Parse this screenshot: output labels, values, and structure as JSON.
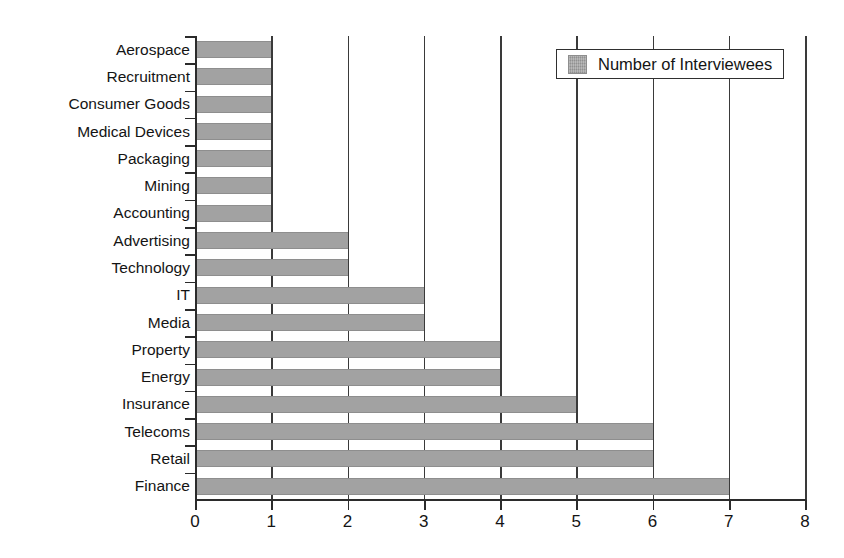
{
  "chart_data": {
    "type": "bar",
    "orientation": "horizontal",
    "title": "",
    "xlabel": "",
    "ylabel": "",
    "xlim": [
      0,
      8
    ],
    "xticks": [
      "0",
      "1",
      "2",
      "3",
      "4",
      "5",
      "6",
      "7",
      "8"
    ],
    "grid": "vertical",
    "legend": {
      "position": "top-right",
      "entries": [
        {
          "label": "Number of Interviewees",
          "color": "#a2a2a2"
        }
      ]
    },
    "categories": [
      "Aerospace",
      "Recruitment",
      "Consumer Goods",
      "Medical Devices",
      "Packaging",
      "Mining",
      "Accounting",
      "Advertising",
      "Technology",
      "IT",
      "Media",
      "Property",
      "Energy",
      "Insurance",
      "Telecoms",
      "Retail",
      "Finance"
    ],
    "series": [
      {
        "name": "Number of Interviewees",
        "color": "#a2a2a2",
        "values": [
          1,
          1,
          1,
          1,
          1,
          1,
          1,
          2,
          2,
          3,
          3,
          4,
          4,
          5,
          6,
          6,
          7
        ]
      }
    ]
  }
}
